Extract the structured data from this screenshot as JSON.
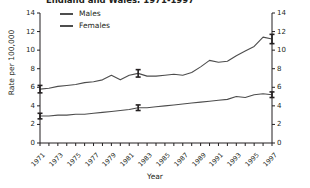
{
  "chart_data": {
    "type": "line",
    "title": "England and Wales, 1971-1997",
    "xlabel": "Year",
    "ylabel": "Rate per 100,000",
    "ylim": [
      0,
      14
    ],
    "xlim": [
      1971,
      1997
    ],
    "grid": false,
    "legend_position": "top-left",
    "yticks": [
      0,
      2,
      4,
      6,
      8,
      10,
      12,
      14
    ],
    "right_axis_yticks": [
      0,
      2,
      4,
      6,
      8,
      10,
      12,
      14
    ],
    "xtick_labels": [
      "1971",
      "1973",
      "1975",
      "1977",
      "1979",
      "1981",
      "1983",
      "1985",
      "1987",
      "1989",
      "1991",
      "1993",
      "1995",
      "1997"
    ],
    "x": [
      1971,
      1972,
      1973,
      1974,
      1975,
      1976,
      1977,
      1978,
      1979,
      1980,
      1981,
      1982,
      1983,
      1984,
      1985,
      1986,
      1987,
      1988,
      1989,
      1990,
      1991,
      1992,
      1993,
      1994,
      1995,
      1996,
      1997
    ],
    "series": [
      {
        "name": "Males",
        "color": "#4d4d4d",
        "values": [
          5.8,
          5.9,
          6.1,
          6.2,
          6.3,
          6.5,
          6.6,
          6.8,
          7.3,
          6.8,
          7.3,
          7.5,
          7.2,
          7.2,
          7.3,
          7.4,
          7.3,
          7.6,
          8.2,
          8.9,
          8.7,
          8.8,
          9.4,
          9.9,
          10.4,
          11.4,
          11.2
        ],
        "error_bars": [
          {
            "x": 1971,
            "y": 5.8,
            "lower": 5.4,
            "upper": 6.2
          },
          {
            "x": 1982,
            "y": 7.5,
            "lower": 7.1,
            "upper": 7.9
          },
          {
            "x": 1997,
            "y": 11.2,
            "lower": 10.7,
            "upper": 11.7
          }
        ]
      },
      {
        "name": "Females",
        "color": "#4d4d4d",
        "values": [
          2.9,
          2.9,
          3.0,
          3.0,
          3.1,
          3.1,
          3.2,
          3.3,
          3.4,
          3.5,
          3.6,
          3.8,
          3.8,
          3.9,
          4.0,
          4.1,
          4.2,
          4.3,
          4.4,
          4.5,
          4.6,
          4.7,
          5.0,
          4.9,
          5.2,
          5.3,
          5.2
        ],
        "error_bars": [
          {
            "x": 1971,
            "y": 2.9,
            "lower": 2.6,
            "upper": 3.2
          },
          {
            "x": 1982,
            "y": 3.8,
            "lower": 3.5,
            "upper": 4.1
          },
          {
            "x": 1997,
            "y": 5.2,
            "lower": 4.9,
            "upper": 5.5
          }
        ]
      }
    ]
  },
  "legend": {
    "items": [
      {
        "label": "Males"
      },
      {
        "label": "Females"
      }
    ]
  },
  "colors": {
    "axis": "#231f20",
    "line": "#4d4d4d",
    "background": "#ffffff"
  }
}
